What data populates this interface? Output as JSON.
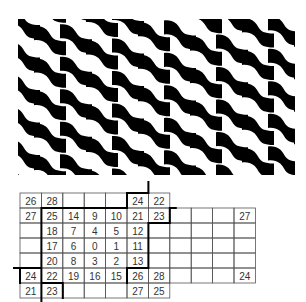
{
  "figure": {
    "top_panel": {
      "description": "Wavy diagonal checkerboard pattern",
      "colors": {
        "dark": "#000000",
        "light": "#ffffff"
      }
    },
    "bottom_panel": {
      "description": "Numbered grid with bold boundary path",
      "rows": 7,
      "cols": 11,
      "cells": [
        [
          "26",
          "28",
          "",
          "",
          "",
          "24",
          "22",
          "",
          "",
          "",
          ""
        ],
        [
          "27",
          "25",
          "14",
          "9",
          "10",
          "21",
          "23",
          "",
          "",
          "",
          "27"
        ],
        [
          "",
          "18",
          "7",
          "4",
          "5",
          "12",
          "",
          "",
          "",
          "",
          ""
        ],
        [
          "",
          "17",
          "6",
          "0",
          "1",
          "11",
          "",
          "",
          "",
          "",
          ""
        ],
        [
          "",
          "20",
          "8",
          "3",
          "2",
          "13",
          "",
          "",
          "",
          "",
          ""
        ],
        [
          "24",
          "22",
          "19",
          "16",
          "15",
          "26",
          "28",
          "",
          "",
          "",
          "24"
        ],
        [
          "21",
          "23",
          "",
          "",
          "",
          "27",
          "25",
          "",
          "",
          "",
          ""
        ]
      ],
      "colors": {
        "grid_line": "#555555",
        "bold_line": "#000000",
        "text": "#333333"
      }
    }
  }
}
